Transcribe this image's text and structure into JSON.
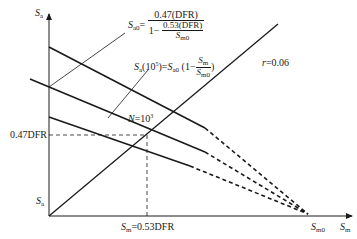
{
  "axes": {
    "y_label": "S",
    "y_label_sub": "a",
    "x_label": "S",
    "x_label_sub": "m"
  },
  "labels": {
    "sa0_formula_lhs": "S",
    "sa0_formula_lhs_sub": "a0",
    "sa0_formula_eq": "=",
    "sa0_formula_num": "0.47(DFR)",
    "sa0_formula_den_prefix": "1−",
    "sa0_formula_den_num": "0.53(DFR)",
    "sa0_formula_den_den": "S",
    "sa0_formula_den_den_sub": "m0",
    "sa_formula_lhs": "S",
    "sa_formula_lhs_sub": "a",
    "sa_formula_arg": "(10",
    "sa_formula_arg_sup": "5",
    "sa_formula_arg_close": ")=",
    "sa_formula_rhs": "S",
    "sa_formula_rhs_sub": "a0",
    "sa_formula_paren": "(1−",
    "sa_formula_frac_num": "S",
    "sa_formula_frac_num_sub": "m",
    "sa_formula_frac_den": "S",
    "sa_formula_frac_den_sub": "m0",
    "sa_formula_close": ")",
    "r_label": "r",
    "r_value": "=0.06",
    "n_label": "N",
    "n_value": "=10",
    "n_value_sup": "3",
    "y_tick_047": "0.47DFR",
    "y_tick_sa": "S",
    "y_tick_sa_sub": "a",
    "x_tick_sm": "S",
    "x_tick_sm_sub": "m",
    "x_tick_sm_value": "=0.53DFR",
    "x_tick_sm0": "S",
    "x_tick_sm0_sub": "m0"
  },
  "colors": {
    "line": "#1a1a1a",
    "background": "#ffffff"
  }
}
